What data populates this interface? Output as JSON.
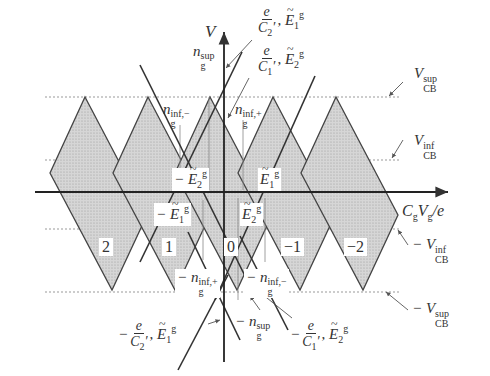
{
  "figure": {
    "type": "coulomb-blockade-stability-diagram",
    "axes": {
      "y_label": "V",
      "x_label_main": "C",
      "x_label_sub1": "g",
      "x_label_mid": "V",
      "x_label_sub2": "g",
      "x_label_tail": "/e"
    },
    "levels": {
      "vcb_sup": {
        "sign": "",
        "base": "V",
        "sub": "CB",
        "sup": "sup"
      },
      "vcb_inf": {
        "sign": "",
        "base": "V",
        "sub": "CB",
        "sup": "inf"
      },
      "neg_vcb_inf": {
        "sign": "− ",
        "base": "V",
        "sub": "CB",
        "sup": "inf"
      },
      "neg_vcb_sup": {
        "sign": "− ",
        "base": "V",
        "sub": "CB",
        "sup": "sup"
      }
    },
    "diamonds": [
      {
        "label": "2",
        "top_x": 85
      },
      {
        "label": "1",
        "top_x": 148
      },
      {
        "label": "0",
        "top_x": 210
      },
      {
        "label": "−1",
        "top_x": 273
      },
      {
        "label": "−2",
        "top_x": 336
      }
    ],
    "annotations": {
      "slope_c2_top": {
        "num": "e",
        "den": "C",
        "den_sub": "2",
        "prime": "′",
        "sep": ",",
        "E": "E",
        "E_sub": "1",
        "E_sup": "g"
      },
      "slope_c1_top": {
        "num": "e",
        "den": "C",
        "den_sub": "1",
        "prime": "′",
        "sep": ",",
        "E": "E",
        "E_sub": "2",
        "E_sup": "g"
      },
      "slope_c2_bottom": {
        "sign": "−",
        "num": "e",
        "den": "C",
        "den_sub": "2",
        "prime": "′",
        "sep": ",",
        "E": "E",
        "E_sub": "1",
        "E_sup": "g"
      },
      "slope_c1_bottom": {
        "sign": "−",
        "num": "e",
        "den": "C",
        "den_sub": "1",
        "prime": "′",
        "sep": ",",
        "E": "E",
        "E_sub": "2",
        "E_sup": "g"
      },
      "ng_sup": {
        "sign": "",
        "base": "n",
        "sub": "g",
        "sup": "sup"
      },
      "ng_inf_minus": {
        "sign": "",
        "base": "n",
        "sub": "g",
        "sup": "inf,−"
      },
      "ng_inf_plus": {
        "sign": "",
        "base": "n",
        "sub": "g",
        "sup": "inf,+"
      },
      "neg_ng_inf_plus": {
        "sign": "− ",
        "base": "n",
        "sub": "g",
        "sup": "inf,+"
      },
      "neg_ng_inf_minus": {
        "sign": "− ",
        "base": "n",
        "sub": "g",
        "sup": "inf,−"
      },
      "neg_ng_sup": {
        "sign": "− ",
        "base": "n",
        "sub": "g",
        "sup": "sup"
      },
      "neg_E2g": {
        "sign": "− ",
        "base": "E",
        "sub": "2",
        "sup": "g"
      },
      "neg_E1g": {
        "sign": "− ",
        "base": "E",
        "sub": "1",
        "sup": "g"
      },
      "E1g": {
        "sign": "",
        "base": "E",
        "sub": "1",
        "sup": "g"
      },
      "E2g": {
        "sign": "",
        "base": "E",
        "sub": "2",
        "sup": "g"
      }
    },
    "colors": {
      "line": "#333333",
      "fill": "#cfcfcf",
      "dotted": "#888888"
    }
  }
}
